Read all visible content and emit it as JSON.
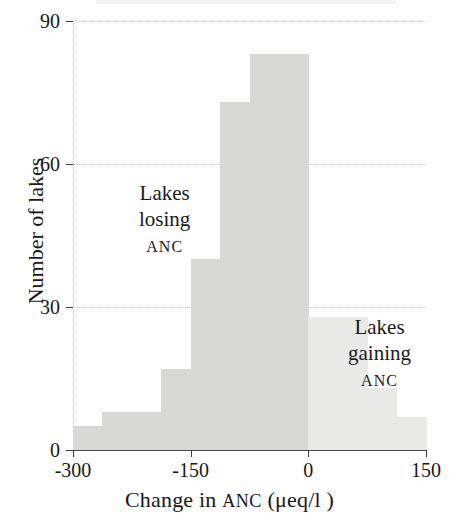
{
  "chart_data": {
    "type": "bar",
    "title": "",
    "xlabel": "Change in ANC (μeq/l )",
    "ylabel": "Number of lakes",
    "xlim": [
      -300,
      150
    ],
    "ylim": [
      0,
      90
    ],
    "grid": true,
    "legend": "none",
    "bin_width": 37.5,
    "xticks": [
      "-300",
      "-150",
      "0",
      "150"
    ],
    "xtick_values": [
      -300,
      -150,
      0,
      150
    ],
    "yticks": [
      "0",
      "30",
      "60",
      "90"
    ],
    "ytick_values": [
      0,
      30,
      60,
      90
    ],
    "bins": [
      {
        "x0": -300,
        "x1": -262.5,
        "value": 5,
        "group": "losing"
      },
      {
        "x0": -262.5,
        "x1": -225,
        "value": 8,
        "group": "losing"
      },
      {
        "x0": -225,
        "x1": -187.5,
        "value": 8,
        "group": "losing"
      },
      {
        "x0": -187.5,
        "x1": -150,
        "value": 17,
        "group": "losing"
      },
      {
        "x0": -150,
        "x1": -112.5,
        "value": 40,
        "group": "losing"
      },
      {
        "x0": -112.5,
        "x1": -75,
        "value": 73,
        "group": "losing"
      },
      {
        "x0": -75,
        "x1": -37.5,
        "value": 83,
        "group": "losing"
      },
      {
        "x0": -37.5,
        "x1": 0,
        "value": 83,
        "group": "losing"
      },
      {
        "x0": 0,
        "x1": 37.5,
        "value": 28,
        "group": "gaining"
      },
      {
        "x0": 37.5,
        "x1": 75,
        "value": 28,
        "group": "gaining"
      },
      {
        "x0": 75,
        "x1": 112.5,
        "value": 13,
        "group": "gaining"
      },
      {
        "x0": 112.5,
        "x1": 150,
        "value": 7,
        "group": "gaining"
      }
    ],
    "colors": {
      "losing_bar": "#d8d8d6",
      "gaining_bar": "#e9e9e7",
      "gridline": "#c9c9c9",
      "axis": "#4a4a4a",
      "text": "#1a1a1a"
    },
    "annotations": [
      {
        "id": "losing",
        "line1": "Lakes",
        "line2": "losing",
        "line3": "ANC"
      },
      {
        "id": "gaining",
        "line1": "Lakes",
        "line2": "gaining",
        "line3": "ANC"
      }
    ]
  },
  "axes": {
    "x_title_pre": "Change in ",
    "x_title_sc": "ANC",
    "x_title_post": " (μeq/l )",
    "y_title": "Number of lakes"
  },
  "annotations": {
    "losing": {
      "line1": "Lakes",
      "line2": "losing",
      "line3": "ANC"
    },
    "gaining": {
      "line1": "Lakes",
      "line2": "gaining",
      "line3": "ANC"
    }
  }
}
